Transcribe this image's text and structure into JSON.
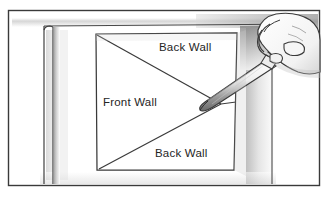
{
  "illustration": {
    "title": "Cutting a foam-board panel with a craft knife",
    "type": "line-art-diagram",
    "colors": {
      "ink": "#2b2b2b",
      "line": "#3a3a3a",
      "paper": "#ffffff",
      "shadow_light": "#d8d8d8",
      "shadow_mid": "#b5b5b5",
      "shadow_dark": "#8a8a8a",
      "label_text": "#252525"
    },
    "frame": {
      "name": "outer-frame",
      "x": 8,
      "y": 10,
      "width": 312,
      "height": 176
    },
    "panel": {
      "name": "cut-square",
      "corners": {
        "top_left": [
          96,
          34
        ],
        "top_right": [
          237,
          33
        ],
        "bottom_right": [
          234,
          170
        ],
        "bottom_left": [
          97,
          170
        ]
      },
      "apex": [
        221,
        104
      ]
    },
    "labels": [
      {
        "id": "label-back-wall-top",
        "text": "Back Wall",
        "x": 159,
        "y": 51
      },
      {
        "id": "label-front-wall",
        "text": "Front Wall",
        "x": 103,
        "y": 106
      },
      {
        "id": "label-back-wall-bottom",
        "text": "Back Wall",
        "x": 155,
        "y": 157
      }
    ],
    "objects": [
      {
        "id": "knife",
        "name": "craft-knife",
        "description": "angled blade pointing down-left to panel center"
      },
      {
        "id": "hand",
        "name": "hand-gripping-knife",
        "description": "hand gripping knife handle at upper right"
      },
      {
        "id": "board",
        "name": "foam-board-sheet",
        "description": "large sheet with raised left edge"
      }
    ]
  }
}
